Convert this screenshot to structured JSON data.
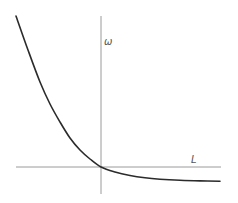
{
  "chart_data": {
    "type": "line",
    "title": "",
    "xlabel": "L",
    "ylabel": "ω",
    "grid": false,
    "legend": null,
    "axes": {
      "origin_px": [
        101,
        167
      ],
      "x_axis_px": {
        "from": 16,
        "to": 220,
        "y": 167
      },
      "y_axis_px": {
        "from": 16,
        "to": 194,
        "x": 101
      }
    },
    "series": [
      {
        "name": "ω(L)",
        "description": "monotonically decreasing convex curve passing through the origin, steep for negative L and flattening toward a small negative asymptote for positive L",
        "points_px": [
          [
            16,
            16
          ],
          [
            28,
            50
          ],
          [
            40,
            82
          ],
          [
            50,
            104
          ],
          [
            60,
            122
          ],
          [
            70,
            138
          ],
          [
            80,
            150
          ],
          [
            90,
            159
          ],
          [
            101,
            167
          ],
          [
            115,
            172
          ],
          [
            130,
            175.5
          ],
          [
            145,
            177.8
          ],
          [
            160,
            179.2
          ],
          [
            180,
            180.3
          ],
          [
            200,
            180.9
          ],
          [
            220,
            181.2
          ]
        ],
        "x_range_px": [
          16,
          220
        ],
        "color": "#2b2b2b"
      }
    ],
    "annotations": []
  },
  "labels": {
    "y_axis": "ω",
    "x_axis": "L"
  },
  "colors": {
    "axis": "#9a9a9a",
    "curve": "#2b2b2b",
    "background": "#ffffff"
  }
}
